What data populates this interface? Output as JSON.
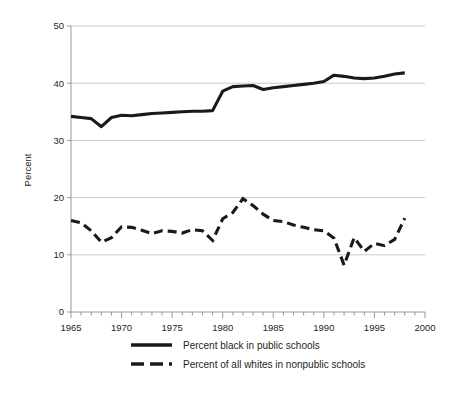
{
  "chart_data": {
    "type": "line",
    "title": "",
    "xlabel": "",
    "ylabel": "Percent",
    "xlim": [
      1965,
      2000
    ],
    "ylim": [
      0,
      50
    ],
    "xticks": [
      1965,
      1970,
      1975,
      1980,
      1985,
      1990,
      1995,
      2000
    ],
    "xtick_labels": [
      "1965",
      "1970",
      "1975",
      "1980",
      "1985",
      "1990",
      "1995",
      "2000"
    ],
    "yticks": [
      0,
      10,
      20,
      30,
      40,
      50
    ],
    "ytick_labels": [
      "0",
      "10",
      "20",
      "30",
      "40",
      "50"
    ],
    "minor_xticks_interval": 1,
    "grid": "horizontal",
    "legend_position": "bottom",
    "x": [
      1965,
      1966,
      1967,
      1968,
      1969,
      1970,
      1971,
      1972,
      1973,
      1974,
      1975,
      1976,
      1977,
      1978,
      1979,
      1980,
      1981,
      1982,
      1983,
      1984,
      1985,
      1986,
      1987,
      1988,
      1989,
      1990,
      1991,
      1992,
      1993,
      1994,
      1995,
      1996,
      1997,
      1998
    ],
    "series": [
      {
        "name": "Percent black in public schools",
        "style": "solid",
        "color": "#1a1a1a",
        "values": [
          34.2,
          34.0,
          33.8,
          32.4,
          34.0,
          34.4,
          34.3,
          34.5,
          34.7,
          34.8,
          34.9,
          35.0,
          35.1,
          35.1,
          35.2,
          38.6,
          39.4,
          39.5,
          39.6,
          38.9,
          39.2,
          39.4,
          39.6,
          39.8,
          40.0,
          40.3,
          41.4,
          41.2,
          40.9,
          40.8,
          40.9,
          41.2,
          41.6,
          41.8
        ]
      },
      {
        "name": "Percent of all whites in nonpublic schools",
        "style": "dashed",
        "color": "#1a1a1a",
        "values": [
          16.0,
          15.6,
          14.2,
          12.2,
          13.0,
          14.9,
          14.8,
          14.3,
          13.7,
          14.2,
          14.1,
          13.8,
          14.4,
          14.2,
          12.5,
          16.3,
          17.4,
          19.8,
          18.6,
          17.1,
          16.0,
          15.8,
          15.2,
          14.8,
          14.4,
          14.2,
          12.9,
          8.2,
          13.0,
          10.6,
          12.0,
          11.6,
          12.7,
          16.4
        ]
      }
    ]
  },
  "legend": {
    "items": [
      {
        "label": "Percent black in public schools",
        "style": "solid"
      },
      {
        "label": "Percent of all whites in nonpublic schools",
        "style": "dashed"
      }
    ]
  }
}
